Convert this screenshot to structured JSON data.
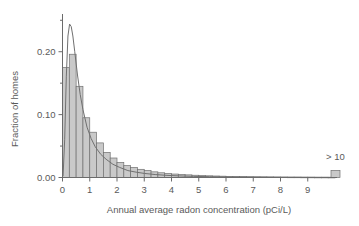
{
  "chart_data": {
    "type": "bar",
    "title": "",
    "subtitle": "",
    "xlabel": "Annual average radon concentration (pCi/L)",
    "ylabel": "Fraction of homes",
    "xlim": [
      0,
      10
    ],
    "ylim": [
      0.0,
      0.26
    ],
    "grid": false,
    "legend": null,
    "bin_width": 0.25,
    "x_tick_labels": [
      "0",
      "1",
      "2",
      "3",
      "4",
      "5",
      "6",
      "7",
      "8",
      "9"
    ],
    "x_tick_values": [
      0,
      1,
      2,
      3,
      4,
      5,
      6,
      7,
      8,
      9
    ],
    "y_tick_labels": [
      "0.00",
      "0.10",
      "0.20"
    ],
    "y_tick_values": [
      0.0,
      0.1,
      0.2
    ],
    "y_minor_ticks": [
      0.05,
      0.15,
      0.25
    ],
    "annotations": [
      {
        "text": "> 10",
        "x": 10.2,
        "y": 0.035,
        "note": "overflow bin label"
      }
    ],
    "bin_centers": [
      0.125,
      0.375,
      0.625,
      0.875,
      1.125,
      1.375,
      1.625,
      1.875,
      2.125,
      2.375,
      2.625,
      2.875,
      3.125,
      3.375,
      3.625,
      3.875,
      4.125,
      4.375,
      4.625,
      4.875,
      5.125,
      5.375,
      5.625,
      5.875,
      6.125,
      6.375,
      6.625,
      6.875,
      7.125,
      7.375,
      7.625,
      7.875,
      8.125,
      8.375,
      8.625,
      8.875,
      9.125,
      9.375,
      9.625,
      9.875
    ],
    "values": [
      0.175,
      0.196,
      0.145,
      0.095,
      0.072,
      0.055,
      0.04,
      0.031,
      0.024,
      0.019,
      0.016,
      0.013,
      0.011,
      0.009,
      0.0075,
      0.0065,
      0.0055,
      0.0048,
      0.0042,
      0.0036,
      0.0031,
      0.0027,
      0.0024,
      0.0021,
      0.0018,
      0.0016,
      0.0014,
      0.0012,
      0.0011,
      0.001,
      0.0009,
      0.0008,
      0.0007,
      0.0006,
      0.0006,
      0.0005,
      0.0005,
      0.0004,
      0.0004,
      0.0003
    ],
    "overflow_bin": {
      "label": "> 10",
      "value": 0.006,
      "x": 10.0,
      "width": 0.25
    },
    "series": [
      {
        "name": "Histogram of homes",
        "type": "bar",
        "categories": [
          0.125,
          0.375,
          0.625,
          0.875,
          1.125,
          1.375,
          1.625,
          1.875,
          2.125,
          2.375,
          2.625,
          2.875,
          3.125,
          3.375,
          3.625,
          3.875,
          4.125,
          4.375,
          4.625,
          4.875,
          5.125,
          5.375,
          5.625,
          5.875,
          6.125,
          6.375,
          6.625,
          6.875,
          7.125,
          7.375,
          7.625,
          7.875,
          8.125,
          8.375,
          8.625,
          8.875,
          9.125,
          9.375,
          9.625,
          9.875
        ],
        "values": [
          0.175,
          0.196,
          0.145,
          0.095,
          0.072,
          0.055,
          0.04,
          0.031,
          0.024,
          0.019,
          0.016,
          0.013,
          0.011,
          0.009,
          0.0075,
          0.0065,
          0.0055,
          0.0048,
          0.0042,
          0.0036,
          0.0031,
          0.0027,
          0.0024,
          0.0021,
          0.0018,
          0.0016,
          0.0014,
          0.0012,
          0.0011,
          0.001,
          0.0009,
          0.0008,
          0.0007,
          0.0006,
          0.0006,
          0.0005,
          0.0005,
          0.0004,
          0.0004,
          0.0003
        ]
      },
      {
        "name": "Fitted lognormal curve",
        "type": "line",
        "x": [
          0.02,
          0.08,
          0.14,
          0.2,
          0.26,
          0.32,
          0.38,
          0.45,
          0.55,
          0.65,
          0.75,
          0.9,
          1.05,
          1.2,
          1.4,
          1.6,
          1.85,
          2.1,
          2.4,
          2.7,
          3.0,
          3.4,
          3.8,
          4.3,
          4.8,
          5.4,
          6.0,
          6.8,
          7.6,
          8.5,
          9.4,
          10.0
        ],
        "y": [
          0.002,
          0.06,
          0.16,
          0.225,
          0.244,
          0.24,
          0.225,
          0.2,
          0.163,
          0.132,
          0.108,
          0.08,
          0.062,
          0.049,
          0.037,
          0.029,
          0.021,
          0.016,
          0.011,
          0.0085,
          0.0065,
          0.0047,
          0.0035,
          0.0025,
          0.0018,
          0.0013,
          0.0009,
          0.0006,
          0.0004,
          0.0003,
          0.0002,
          0.0002
        ]
      }
    ]
  },
  "axes": {
    "x_title": "Annual average radon concentration (pCi/L)",
    "y_title": "Fraction of homes"
  },
  "colors": {
    "bar_fill": "#c9c9c9",
    "bar_stroke": "#707070",
    "curve": "#707070",
    "axis": "#6b6b6b",
    "text": "#5a5a5a",
    "background": "#ffffff"
  }
}
